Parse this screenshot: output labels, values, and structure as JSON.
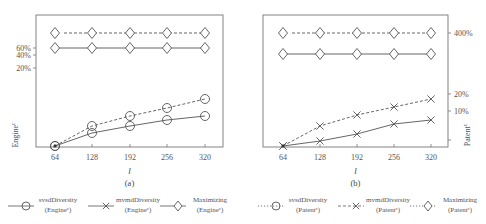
{
  "chart_data": [
    {
      "type": "line",
      "panel_label": "(a)",
      "xlabel": "l",
      "ylabel": "Engine^c",
      "x": [
        64,
        128,
        192,
        256,
        320
      ],
      "y_ticks_left": [
        "60%",
        "40%",
        "20%"
      ],
      "series": [
        {
          "name": "svsdDiversity (Engine^c)",
          "marker": "circle",
          "line": "solid",
          "pixel_y": [
            146,
            133,
            126,
            120,
            116
          ]
        },
        {
          "name": "svsdDiversity dashed variant",
          "marker": "circle",
          "line": "dashed",
          "pixel_y": [
            146,
            126,
            116,
            108,
            99
          ]
        },
        {
          "name": "Maximizing (Engine^c) solid",
          "marker": "diamond",
          "line": "solid",
          "pixel_y": [
            48,
            48,
            48,
            48,
            48
          ]
        },
        {
          "name": "Maximizing (Engine^c) dashed",
          "marker": "diamond",
          "line": "dashed",
          "pixel_y": [
            33,
            33,
            33,
            33,
            33
          ]
        }
      ],
      "legend": [
        {
          "marker": "circle",
          "line": "solid",
          "label1": "svsdDiversity",
          "label2": "(Engine",
          "sup": "c",
          "label3": ")"
        },
        {
          "marker": "x",
          "line": "solid",
          "label1": "mvmdDiversity",
          "label2": "(Engine",
          "sup": "c",
          "label3": ")"
        },
        {
          "marker": "diamond",
          "line": "solid",
          "label1": "Maximizing",
          "label2": "(Engine",
          "sup": "c",
          "label3": ")"
        }
      ]
    },
    {
      "type": "line",
      "panel_label": "(b)",
      "xlabel": "l",
      "ylabel": "Patent^c",
      "x": [
        64,
        128,
        192,
        256,
        320
      ],
      "y_ticks_right": [
        "400%",
        "20%",
        "10%"
      ],
      "series": [
        {
          "name": "mvmdDiversity (Patent^c) solid",
          "marker": "x",
          "line": "solid",
          "pixel_y": [
            146,
            141,
            134,
            124,
            120
          ]
        },
        {
          "name": "mvmdDiversity (Patent^c) dashed",
          "marker": "x",
          "line": "dashed",
          "pixel_y": [
            146,
            126,
            115,
            107,
            99
          ]
        },
        {
          "name": "Maximizing (Patent^c) solid",
          "marker": "diamond",
          "line": "solid",
          "pixel_y": [
            54,
            54,
            54,
            54,
            54
          ]
        },
        {
          "name": "Maximizing (Patent^c) dashed",
          "marker": "diamond",
          "line": "dashed",
          "pixel_y": [
            33,
            33,
            33,
            33,
            33
          ]
        }
      ],
      "legend": [
        {
          "marker": "circle",
          "line": "dotted",
          "label1": "svsdDiversity",
          "label2": "(Patent",
          "sup": "c",
          "label3": ")"
        },
        {
          "marker": "x",
          "line": "dashed",
          "label1": "mvmdDiversity",
          "label2": "(Patent",
          "sup": "c",
          "label3": ")"
        },
        {
          "marker": "diamond",
          "line": "dotted",
          "label1": "Maximizing",
          "label2": "(Patent",
          "sup": "c",
          "label3": ")"
        }
      ]
    }
  ]
}
